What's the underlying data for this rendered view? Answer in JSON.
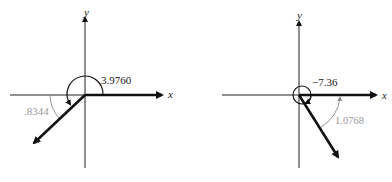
{
  "figures": [
    {
      "id": "left",
      "x_label": "x",
      "y_label": "y",
      "angle_label": "3.9760",
      "reference_angle_label": ".8344",
      "origin": [
        85,
        95
      ],
      "vector_end": [
        33,
        144
      ],
      "colors": {
        "axes": "#222222",
        "vector": "#111111",
        "reference": "#8a8a8a"
      }
    },
    {
      "id": "right",
      "x_label": "x",
      "y_label": "y",
      "angle_label": "−7.36",
      "reference_angle_label": "1.0768",
      "origin": [
        299,
        95
      ],
      "vector_end": [
        338,
        158
      ],
      "colors": {
        "axes": "#222222",
        "vector": "#111111",
        "reference": "#8a8a8a"
      }
    }
  ]
}
